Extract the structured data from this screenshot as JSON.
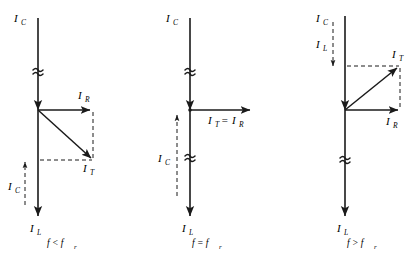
{
  "figure": {
    "background_color": "#ffffff",
    "line_color": "#1a1a1a"
  },
  "panels": [
    {
      "id": "below-resonance",
      "caption": "f < f",
      "caption_sub": "r",
      "caption_text": "f < f_r",
      "labels": {
        "top_axis": "I",
        "top_axis_sub": "C",
        "bottom_axis": "I",
        "bottom_axis_sub": "L",
        "horizontal_vector": "I",
        "horizontal_vector_sub": "R",
        "resultant_vector": "I",
        "resultant_vector_sub": "T",
        "net_segment": "I",
        "net_segment_sub": "C"
      },
      "description": "I_L exceeds I_C so the resultant I_T points down and to the right (lagging, inductive)."
    },
    {
      "id": "at-resonance",
      "caption": "f = f",
      "caption_sub": "r",
      "caption_text": "f = f_r",
      "labels": {
        "top_axis": "I",
        "top_axis_sub": "C",
        "bottom_axis": "I",
        "bottom_axis_sub": "L",
        "resultant_vector": "I",
        "resultant_vector_sub": "T",
        "equals": "=",
        "resistive_vector": "I",
        "resistive_vector_sub": "R",
        "net_segment": "I",
        "net_segment_sub": "C"
      },
      "description": "I_C equals I_L so the reactive parts cancel and I_T = I_R lies on the horizontal axis."
    },
    {
      "id": "above-resonance",
      "caption": "f > f",
      "caption_sub": "r",
      "caption_text": "f > f_r",
      "labels": {
        "top_axis": "I",
        "top_axis_sub": "C",
        "net_segment": "I",
        "net_segment_sub": "L",
        "bottom_axis": "I",
        "bottom_axis_sub": "L",
        "horizontal_vector": "I",
        "horizontal_vector_sub": "R",
        "resultant_vector": "I",
        "resultant_vector_sub": "T"
      },
      "description": "I_C exceeds I_L so the resultant I_T points up and to the right (leading, capacitive)."
    }
  ]
}
